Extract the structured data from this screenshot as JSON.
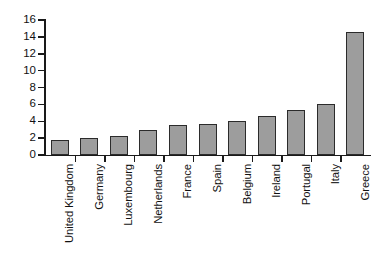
{
  "chart_data": {
    "type": "bar",
    "title": "",
    "subtitle": "",
    "xlabel": "",
    "ylabel": "",
    "categories": [
      "United Kingdom",
      "Germany",
      "Luxembourg",
      "Netherlands",
      "France",
      "Spain",
      "Belgium",
      "Ireland",
      "Portugal",
      "Italy",
      "Greece"
    ],
    "values": [
      1.8,
      2.0,
      2.2,
      3.0,
      3.5,
      3.7,
      4.0,
      4.6,
      5.3,
      6.0,
      14.6
    ],
    "ylim": [
      0,
      16
    ],
    "ytick_values": [
      0,
      2,
      4,
      6,
      8,
      10,
      12,
      14,
      16
    ],
    "ytick_labels": [
      "0",
      "2",
      "4",
      "6",
      "8",
      "10",
      "12",
      "14",
      "16"
    ],
    "grid": false,
    "legend": false,
    "legend_position": "none",
    "bar_color": "#9d9d9d",
    "bar_edge_color": "#2b2b2b",
    "axis_color": "#1a1a1a",
    "background_color": "#ffffff",
    "annotations": []
  }
}
